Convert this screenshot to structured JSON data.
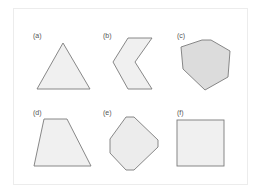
{
  "figure": {
    "panels": [
      {
        "label": "(a)",
        "shape": "triangle"
      },
      {
        "label": "(b)",
        "shape": "chevron"
      },
      {
        "label": "(c)",
        "shape": "heptagon"
      },
      {
        "label": "(d)",
        "shape": "trapezoid"
      },
      {
        "label": "(e)",
        "shape": "rounded-diamond"
      },
      {
        "label": "(f)",
        "shape": "square"
      }
    ],
    "colors": {
      "stroke": "#7a7a7a",
      "fill_light": "#f0f0f0",
      "fill_dark": "#dcdcdc",
      "frame": "#ececec",
      "label": "#555555"
    }
  }
}
